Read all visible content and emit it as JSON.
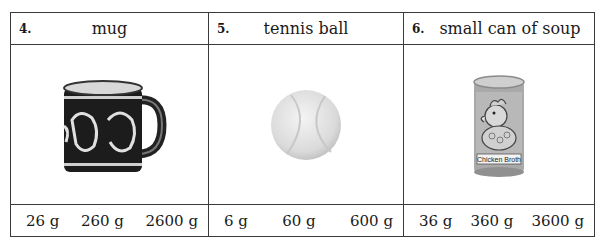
{
  "items": [
    {
      "number": "4.",
      "name": "mug",
      "image": "mug-photo",
      "options": [
        "26 g",
        "260 g",
        "2600 g"
      ]
    },
    {
      "number": "5.",
      "name": "tennis ball",
      "image": "tennis-ball-photo",
      "options": [
        "6 g",
        "60 g",
        "600 g"
      ]
    },
    {
      "number": "6.",
      "name": "small can of soup",
      "image": "soup-can-photo",
      "can_label": "Chicken Broth",
      "options": [
        "36 g",
        "360 g",
        "3600 g"
      ]
    }
  ]
}
